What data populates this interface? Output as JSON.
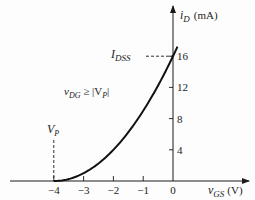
{
  "chart_data": {
    "type": "line",
    "title": "",
    "xlabel": "v_GS (V)",
    "xlabel_main": "v",
    "xlabel_sub": "GS",
    "xlabel_unit": "(V)",
    "ylabel": "i_D (mA)",
    "ylabel_main": "i",
    "ylabel_sub": "D",
    "ylabel_unit": "(mA)",
    "xlim": [
      -5.6,
      2.5
    ],
    "ylim": [
      0,
      22
    ],
    "x_ticks": [
      -4,
      -3,
      -2,
      -1,
      0
    ],
    "x_tick_labels": [
      "−4",
      "−3",
      "−2",
      "−1",
      "0"
    ],
    "y_ticks": [
      4,
      8,
      12,
      16
    ],
    "y_tick_labels": [
      "4",
      "8",
      "12",
      "16"
    ],
    "grid": false,
    "series": [
      {
        "name": "i_D = I_DSS (1 - v_GS/V_P)^2",
        "I_DSS": 16,
        "V_P": -4,
        "x_range": [
          -4,
          0.15
        ]
      }
    ],
    "annotations": {
      "idss": {
        "main": "I",
        "sub": "DSS",
        "value": 16
      },
      "vp": {
        "main": "V",
        "sub": "P",
        "value": -4
      },
      "condition": {
        "main": "v",
        "sub": "DG",
        "rest": " ≥ |V",
        "sub2": "P",
        "close": "|"
      }
    }
  },
  "colors": {
    "ink": "#1a1a1a",
    "background": "#fdfdfd"
  }
}
